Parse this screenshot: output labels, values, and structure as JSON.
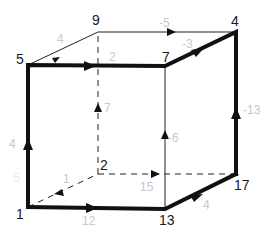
{
  "diagram": {
    "type": "weighted directed cube graph",
    "vertices": [
      {
        "id": "v5",
        "label": "5",
        "position": "top-front-left"
      },
      {
        "id": "v9",
        "label": "9",
        "position": "top-back-left"
      },
      {
        "id": "v4",
        "label": "4",
        "position": "top-back-right"
      },
      {
        "id": "v7",
        "label": "7",
        "position": "top-front-right"
      },
      {
        "id": "v1",
        "label": "1",
        "position": "bottom-front-left"
      },
      {
        "id": "v2",
        "label": "2",
        "position": "bottom-back-left"
      },
      {
        "id": "v13",
        "label": "13",
        "position": "bottom-front-right"
      },
      {
        "id": "v17",
        "label": "17",
        "position": "bottom-back-right"
      }
    ],
    "edges": [
      {
        "from": "5",
        "to": "9",
        "weight": "4",
        "style": "thin"
      },
      {
        "from": "9",
        "to": "4",
        "weight": "-5",
        "style": "thin"
      },
      {
        "from": "5",
        "to": "7",
        "weight": "2",
        "style": "bold"
      },
      {
        "from": "7",
        "to": "4",
        "weight": "-3",
        "style": "bold"
      },
      {
        "from": "2",
        "to": "9",
        "weight": "7",
        "style": "dashed"
      },
      {
        "from": "13",
        "to": "7",
        "weight": "-6",
        "style": "thin"
      },
      {
        "from": "17",
        "to": "4",
        "weight": "-13",
        "style": "bold"
      },
      {
        "from": "1",
        "to": "5",
        "weight": "4",
        "style": "bold"
      },
      {
        "from": "1",
        "to": "2",
        "weight": "1",
        "style": "dashed"
      },
      {
        "from": "1",
        "to": "13",
        "weight": "12",
        "style": "bold"
      },
      {
        "from": "2",
        "to": "17",
        "weight": "15",
        "style": "dashed"
      },
      {
        "from": "13",
        "to": "17",
        "weight": "4",
        "style": "bold"
      }
    ],
    "extra_labels": {
      "faint_left": "5"
    }
  }
}
